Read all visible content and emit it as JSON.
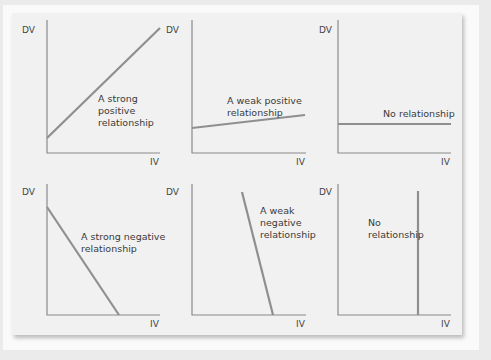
{
  "colors": {
    "background": "#ebebeb",
    "card": "#f1f1f1",
    "axis": "#8a8a8a",
    "line": "#8f8f8f",
    "text": "#3a3a3a"
  },
  "axis_labels": {
    "y": "DV",
    "x": "IV"
  },
  "panels": [
    {
      "id": "strong-positive",
      "label": "A strong\npositive\nrelationship"
    },
    {
      "id": "weak-positive",
      "label": "A weak positive\nrelationship"
    },
    {
      "id": "no-relationship-horizontal",
      "label": "No relationship"
    },
    {
      "id": "strong-negative",
      "label": "A strong negative\nrelationship"
    },
    {
      "id": "weak-negative",
      "label": "A weak\nnegative\nrelationship"
    },
    {
      "id": "no-relationship-vertical",
      "label": "No\nrelationship"
    }
  ]
}
